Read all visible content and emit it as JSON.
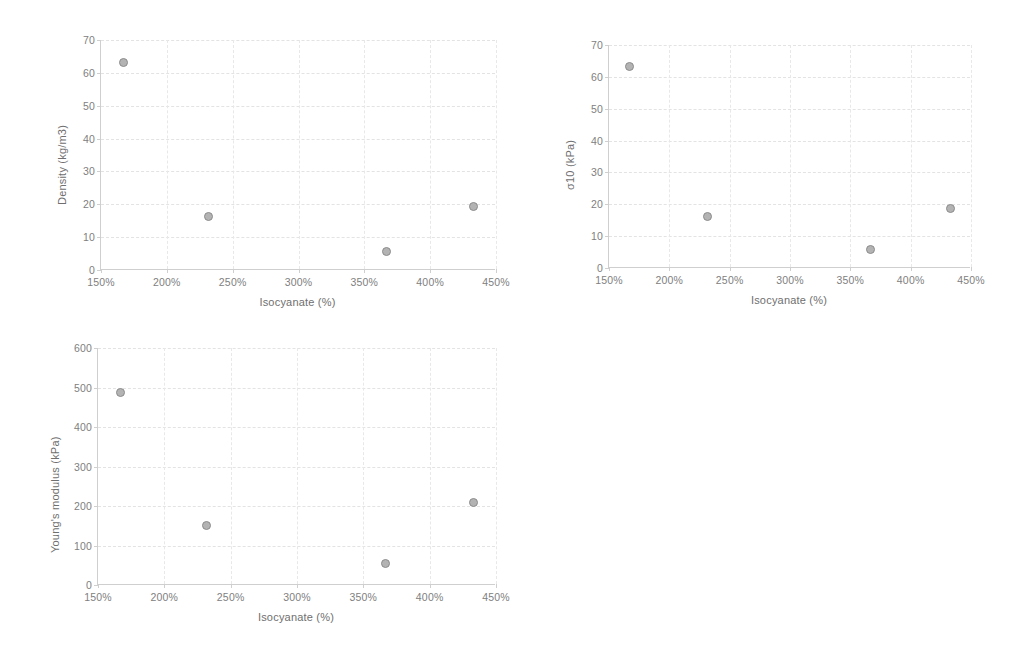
{
  "page": {
    "background": "#ffffff",
    "marker_fill": "#b3b3b3",
    "marker_stroke": "#8c8c8c",
    "axis_color": "#cfcfcf",
    "grid_color": "#e3e3e3",
    "text_color": "#6f6f6f"
  },
  "chart_data": [
    {
      "type": "scatter",
      "name": "density-vs-isocyanate",
      "title": "",
      "xlabel": "Isocyanate (%)",
      "ylabel": "Density (kg/m3)",
      "xlim": [
        150,
        450
      ],
      "ylim": [
        0,
        70
      ],
      "xticks": [
        150,
        200,
        250,
        300,
        350,
        400,
        450
      ],
      "xticklabels": [
        "150%",
        "200%",
        "250%",
        "300%",
        "350%",
        "400%",
        "450%"
      ],
      "yticks": [
        0,
        10,
        20,
        30,
        40,
        50,
        60,
        70
      ],
      "yticklabels": [
        "0",
        "10",
        "20",
        "30",
        "40",
        "50",
        "60",
        "70"
      ],
      "grid": true,
      "legend": false,
      "x": [
        167,
        232,
        367,
        433
      ],
      "y": [
        63.2,
        16.3,
        5.7,
        19.3
      ]
    },
    {
      "type": "scatter",
      "name": "sigma10-vs-isocyanate",
      "title": "",
      "xlabel": "Isocyanate (%)",
      "ylabel": "σ10 (kPa)",
      "xlim": [
        150,
        450
      ],
      "ylim": [
        0,
        70
      ],
      "xticks": [
        150,
        200,
        250,
        300,
        350,
        400,
        450
      ],
      "xticklabels": [
        "150%",
        "200%",
        "250%",
        "300%",
        "350%",
        "400%",
        "450%"
      ],
      "yticks": [
        0,
        10,
        20,
        30,
        40,
        50,
        60,
        70
      ],
      "yticklabels": [
        "0",
        "10",
        "20",
        "30",
        "40",
        "50",
        "60",
        "70"
      ],
      "grid": true,
      "legend": false,
      "x": [
        167,
        232,
        367,
        433
      ],
      "y": [
        63.3,
        16.2,
        5.8,
        18.8
      ]
    },
    {
      "type": "scatter",
      "name": "youngs-modulus-vs-isocyanate",
      "title": "",
      "xlabel": "Isocyanate (%)",
      "ylabel": "Young's modulus (kPa)",
      "xlim": [
        150,
        450
      ],
      "ylim": [
        0,
        600
      ],
      "xticks": [
        150,
        200,
        250,
        300,
        350,
        400,
        450
      ],
      "xticklabels": [
        "150%",
        "200%",
        "250%",
        "300%",
        "350%",
        "400%",
        "450%"
      ],
      "yticks": [
        0,
        100,
        200,
        300,
        400,
        500,
        600
      ],
      "yticklabels": [
        "0",
        "100",
        "200",
        "300",
        "400",
        "500",
        "600"
      ],
      "grid": true,
      "legend": false,
      "x": [
        167,
        232,
        367,
        433
      ],
      "y": [
        487,
        150,
        55,
        210
      ]
    }
  ]
}
